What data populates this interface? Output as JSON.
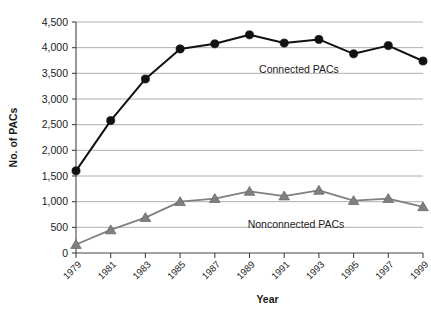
{
  "chart_data": {
    "type": "line",
    "title": "",
    "xlabel": "Year",
    "ylabel": "No. of PACs",
    "x": [
      1979,
      1981,
      1983,
      1985,
      1987,
      1989,
      1991,
      1993,
      1995,
      1997,
      1999
    ],
    "categories": [
      "1979",
      "1981",
      "1983",
      "1985",
      "1987",
      "1989",
      "1991",
      "1993",
      "1995",
      "1997",
      "1999"
    ],
    "series": [
      {
        "name": "Connected PACs",
        "color": "#111111",
        "marker": "circle",
        "values": [
          1600,
          2580,
          3390,
          3975,
          4075,
          4250,
          4090,
          4160,
          3880,
          4040,
          3740
        ]
      },
      {
        "name": "Nonconnected PACs",
        "color": "#808080",
        "marker": "triangle",
        "values": [
          165,
          450,
          690,
          1000,
          1060,
          1200,
          1110,
          1220,
          1020,
          1060,
          900
        ]
      }
    ],
    "ylim": [
      0,
      4500
    ],
    "yticks": [
      0,
      500,
      1000,
      1500,
      2000,
      2500,
      3000,
      3500,
      4000,
      4500
    ],
    "ytick_labels": [
      "0",
      "500",
      "1,000",
      "1,500",
      "2,000",
      "2,500",
      "3,000",
      "3,500",
      "4,000",
      "4,500"
    ],
    "grid": true,
    "grid_color": "#9a9a9a",
    "legend_position": "inline-annotations",
    "annotations": [
      {
        "text": "Connected PACs",
        "x_px": 299,
        "y_px": 73
      },
      {
        "text": "Nonconnected PACs",
        "x_px": 296,
        "y_px": 228
      }
    ],
    "background": "#ffffff"
  }
}
